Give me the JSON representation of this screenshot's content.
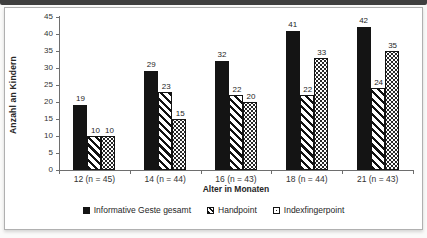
{
  "chart_data": {
    "type": "bar",
    "title": "",
    "categories": [
      "12 (n = 45)",
      "14 (n = 44)",
      "16 (n = 43)",
      "18 (n = 44)",
      "21 (n = 43)"
    ],
    "series": [
      {
        "name": "Informative Geste gesamt",
        "pattern": "solid",
        "values": [
          19,
          29,
          32,
          41,
          42
        ]
      },
      {
        "name": "Handpoint",
        "pattern": "diagonal-hatch",
        "values": [
          10,
          23,
          22,
          22,
          24
        ]
      },
      {
        "name": "Indexfingerpoint",
        "pattern": "dots",
        "values": [
          10,
          15,
          20,
          33,
          35
        ]
      }
    ],
    "xlabel": "Alter in Monaten",
    "ylabel": "Anzahl an Kindern",
    "ylim": [
      0,
      45
    ],
    "ytick_step": 5,
    "grid": false,
    "legend_position": "bottom"
  },
  "colors": {
    "bar_fill": "#141414",
    "axis": "#6e6e6e",
    "text": "#262626",
    "chart_border": "#b0b0b0",
    "top_strip": "#3f3f3f",
    "chart_background": "#ffffff"
  }
}
